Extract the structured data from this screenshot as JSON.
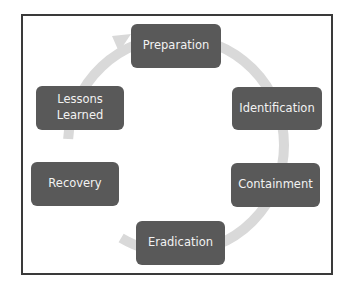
{
  "diagram": {
    "type": "cycle",
    "colors": {
      "node_fill": "#595959",
      "node_text": "#f2f2f2",
      "arrow": "#d9d9d9",
      "frame": "#3a3a3a"
    },
    "nodes": [
      {
        "id": "preparation",
        "label": "Preparation"
      },
      {
        "id": "identification",
        "label": "Identification"
      },
      {
        "id": "containment",
        "label": "Containment"
      },
      {
        "id": "eradication",
        "label": "Eradication"
      },
      {
        "id": "recovery",
        "label": "Recovery"
      },
      {
        "id": "lessons-learned",
        "label": "Lessons\nLearned"
      }
    ],
    "flow": "clockwise, arrow points into Preparation"
  }
}
